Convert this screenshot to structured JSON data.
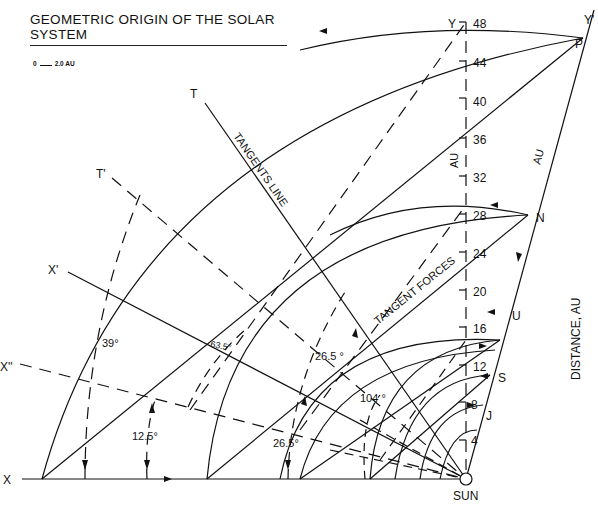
{
  "title": "GEOMETRIC ORIGIN OF THE SOLAR SYSTEM",
  "scale": {
    "start": "0",
    "end": "2.0 AU"
  },
  "points": {
    "Y": "Y",
    "Yprime": "Y'",
    "P": "P",
    "N": "N",
    "U": "U",
    "S": "S",
    "J": "J",
    "T": "T",
    "Tprime": "T'",
    "Xprime": "X'",
    "Xdoubleprime": "X''",
    "X": "X",
    "sun": "SUN"
  },
  "axis": {
    "ticks": [
      "4",
      "8",
      "12",
      "16",
      "20",
      "24",
      "28",
      "32",
      "36",
      "40",
      "44",
      "48"
    ],
    "unit_vertical": "AU",
    "unit_diagonal": "AU",
    "side_label": "DISTANCE, AU"
  },
  "labels": {
    "tangents_line": "TANGENTS LINE",
    "tangent_forces": "TANGENT FORCES"
  },
  "angles": {
    "a39": "39°",
    "a12_5": "12.5°",
    "a63_5": "63.5°",
    "a26_5_upper": "26.5 °",
    "a26_5_lower": "26.5°",
    "a104": "104 °"
  }
}
